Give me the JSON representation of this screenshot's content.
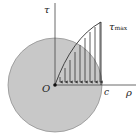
{
  "diagram": {
    "labels": {
      "tau_axis": "τ",
      "rho_axis": "ρ",
      "origin": "O",
      "radius": "c",
      "tau_max_symbol": "τ",
      "tau_max_sub": "max"
    },
    "colors": {
      "section_fill": "#c8c8c8",
      "section_stroke": "#777777",
      "lines": "#333333",
      "background": "#ffffff"
    },
    "geometry": {
      "origin": [
        55,
        85
      ],
      "radius_px": 47,
      "peak": [
        101,
        22
      ],
      "arrow_count": 9
    }
  }
}
